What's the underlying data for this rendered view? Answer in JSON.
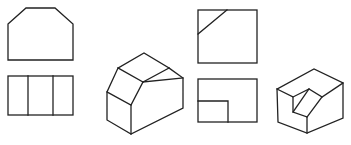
{
  "figure": {
    "stroke_color": "#222222",
    "background": "#ffffff",
    "views": [
      {
        "name": "front-view-chamfered-prism",
        "type": "orthographic"
      },
      {
        "name": "top-view-three-panels",
        "type": "orthographic"
      },
      {
        "name": "isometric-chamfered-prism",
        "type": "isometric"
      },
      {
        "name": "top-view-diagonal-cut",
        "type": "orthographic"
      },
      {
        "name": "front-view-notched-block",
        "type": "orthographic"
      },
      {
        "name": "isometric-notched-block",
        "type": "isometric"
      }
    ]
  }
}
